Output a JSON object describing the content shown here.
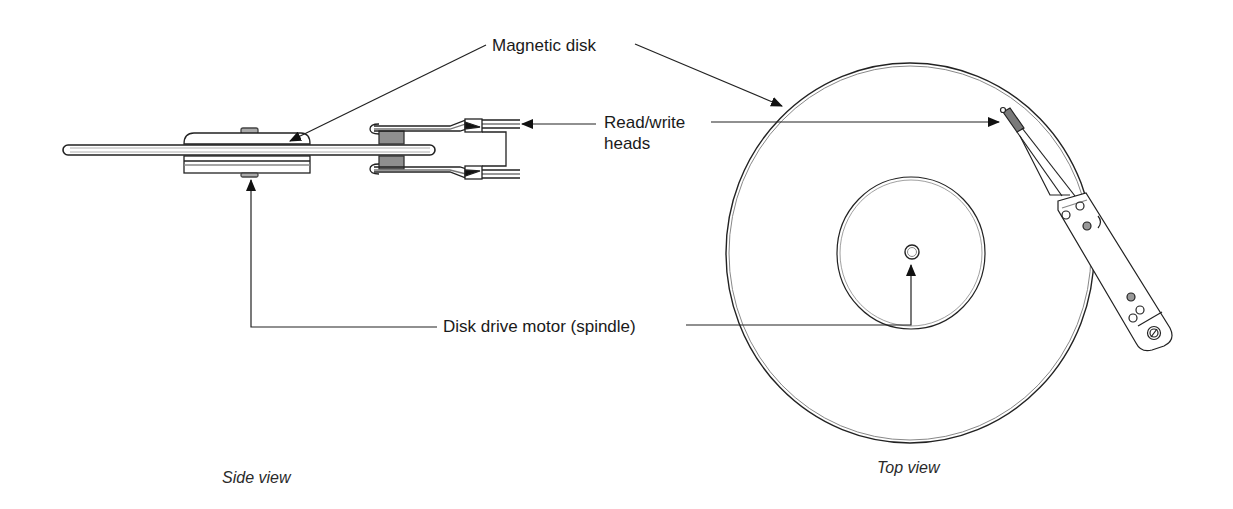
{
  "diagram": {
    "labels": {
      "magnetic_disk": "Magnetic disk",
      "read_write_line1": "Read/write",
      "read_write_line2": "heads",
      "spindle": "Disk drive motor (spindle)",
      "side_view": "Side view",
      "top_view": "Top view"
    },
    "colors": {
      "line": "#222222",
      "fill_gray": "#9a9a9a",
      "background": "#ffffff"
    }
  }
}
